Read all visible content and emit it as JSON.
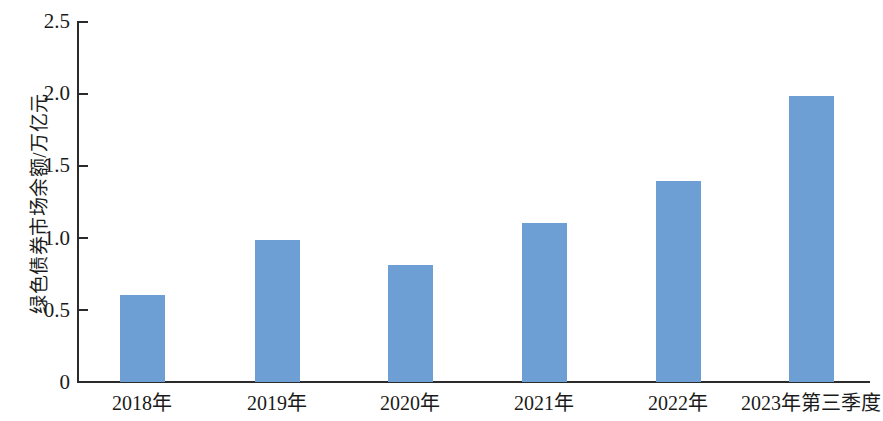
{
  "chart_data": {
    "type": "bar",
    "title": "",
    "subtitle": "",
    "xlabel": "",
    "ylabel": "绿色债券市场余额/万亿元",
    "categories": [
      "2018年",
      "2019年",
      "2020年",
      "2021年",
      "2022年",
      "2023年第三季度"
    ],
    "values": [
      0.6,
      0.98,
      0.81,
      1.1,
      1.39,
      1.98
    ],
    "series": [
      {
        "name": "绿色债券市场余额",
        "values": [
          0.6,
          0.98,
          0.81,
          1.1,
          1.39,
          1.98
        ]
      }
    ],
    "ylim": [
      0,
      2.5
    ],
    "ytick_labels": [
      "0",
      "0.5",
      "1.0",
      "1.5",
      "2.0",
      "2.5"
    ],
    "ytick_values": [
      0,
      0.5,
      1.0,
      1.5,
      2.0,
      2.5
    ],
    "grid": false,
    "legend": false,
    "legend_position": "none",
    "bar_color": "#6d9ed4",
    "axis_color": "#2b2b2b",
    "text_color": "#1a1a1a",
    "unit": "万亿元"
  }
}
